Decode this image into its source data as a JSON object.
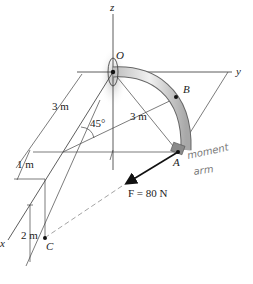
{
  "figure": {
    "axes": {
      "z": "z",
      "y": "y",
      "x": "x"
    },
    "points": {
      "O": "O",
      "B": "B",
      "A": "A",
      "C": "C"
    },
    "dimensions": {
      "x_dim": "3 m",
      "radius": "3 m",
      "offset_1": "1 m",
      "height_c": "2 m",
      "angle": "45°"
    },
    "force": {
      "label": "F = 80 N",
      "symbol": "F",
      "magnitude": "80 N"
    },
    "annotation": {
      "line1": "moment",
      "line2": "arm"
    },
    "colors": {
      "ink": "#222222",
      "pipe": "#d8d8d8",
      "handwriting": "#7a7a7a"
    }
  }
}
